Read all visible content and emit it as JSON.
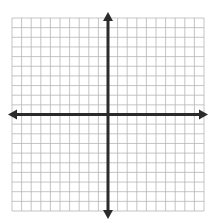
{
  "figure": {
    "title": "",
    "artifact_text": "ry",
    "width": 215,
    "height": 224,
    "background_color": "#ffffff"
  },
  "chart_data": {
    "type": "scatter",
    "title": "",
    "subtitle": "",
    "xlabel": "",
    "ylabel": "",
    "x": [],
    "y": [],
    "series": [],
    "annotations": [],
    "legend": null,
    "legend_position": "none",
    "grid": true,
    "grid_columns": 20,
    "grid_rows": 20,
    "xlim": [
      -10,
      10
    ],
    "ylim": [
      -10,
      10
    ],
    "xticks": [
      -10,
      -9,
      -8,
      -7,
      -6,
      -5,
      -4,
      -3,
      -2,
      -1,
      0,
      1,
      2,
      3,
      4,
      5,
      6,
      7,
      8,
      9,
      10
    ],
    "yticks": [
      -10,
      -9,
      -8,
      -7,
      -6,
      -5,
      -4,
      -3,
      -2,
      -1,
      0,
      1,
      2,
      3,
      4,
      5,
      6,
      7,
      8,
      9,
      10
    ],
    "xtick_labels": [],
    "ytick_labels": [],
    "origin": [
      0,
      0
    ],
    "axis_arrows": [
      "left",
      "right",
      "up",
      "down"
    ],
    "grid_color": "#b5b5b5",
    "axis_color": "#2b2b2b",
    "grid_line_width": 0.8,
    "axis_line_width": 3
  },
  "geometry": {
    "grid_left": 12,
    "grid_top": 18,
    "grid_right": 204,
    "grid_bottom": 211,
    "origin_x": 108,
    "origin_y": 114.5,
    "cell_w": 9.6,
    "cell_h": 9.65,
    "arrow_left_tip": 8,
    "arrow_right_tip": 208,
    "arrow_top_tip": 12,
    "arrow_bottom_tip": 219
  }
}
